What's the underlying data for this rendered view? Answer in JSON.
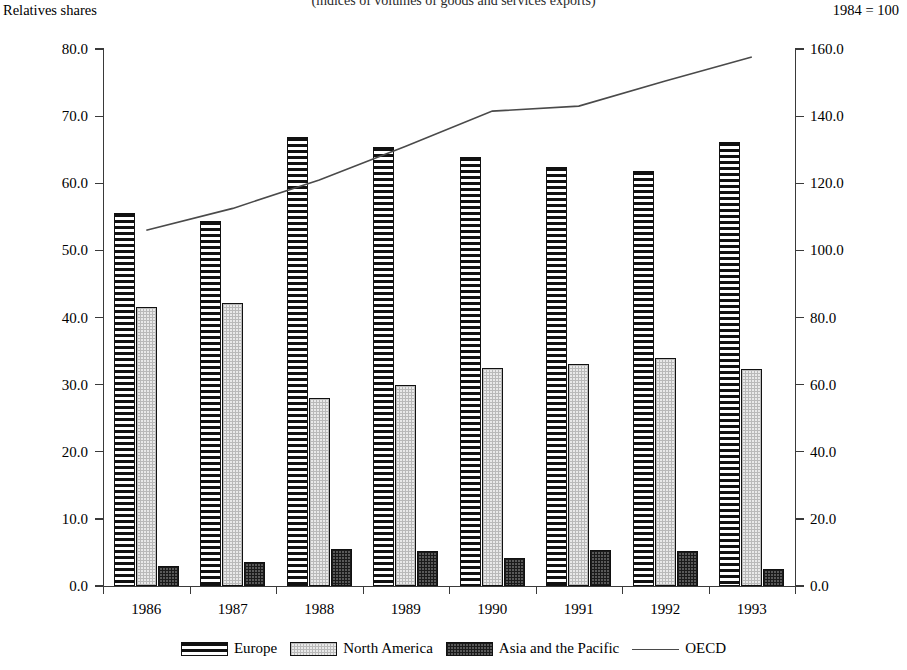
{
  "header": {
    "cut_title": "(indices of volumes of goods and services exports)",
    "left_label": "Relatives shares",
    "right_label": "1984 = 100"
  },
  "legend": {
    "items": [
      {
        "label": "Europe",
        "swatch": "horizontal-stripe-swatch"
      },
      {
        "label": "North America",
        "swatch": "light-dotted-swatch"
      },
      {
        "label": "Asia and the Pacific",
        "swatch": "dark-dotted-swatch"
      },
      {
        "label": "OECD",
        "swatch": "line-swatch"
      }
    ]
  },
  "chart_data": {
    "type": "bar",
    "title": "(indices of volumes of goods and services exports)",
    "xlabel": "",
    "ylabel": "Relatives shares",
    "y2label": "1984 = 100",
    "grid": false,
    "legend_position": "bottom",
    "categories": [
      "1986",
      "1987",
      "1988",
      "1989",
      "1990",
      "1991",
      "1992",
      "1993"
    ],
    "ylim": [
      0.0,
      80.0
    ],
    "yticks": [
      "0.0",
      "10.0",
      "20.0",
      "30.0",
      "40.0",
      "50.0",
      "60.0",
      "70.0",
      "80.0"
    ],
    "y2lim": [
      0.0,
      160.0
    ],
    "y2ticks": [
      "0.0",
      "20.0",
      "40.0",
      "60.0",
      "80.0",
      "100.0",
      "120.0",
      "140.0",
      "160.0"
    ],
    "series": [
      {
        "name": "Europe",
        "axis": "left",
        "kind": "bar",
        "values": [
          55.6,
          54.4,
          66.9,
          65.4,
          63.9,
          62.4,
          61.9,
          66.2
        ]
      },
      {
        "name": "North America",
        "axis": "left",
        "kind": "bar",
        "values": [
          41.6,
          42.2,
          28.0,
          30.0,
          32.5,
          33.1,
          33.9,
          32.4
        ]
      },
      {
        "name": "Asia and the Pacific",
        "axis": "left",
        "kind": "bar",
        "values": [
          3.0,
          3.6,
          5.5,
          5.2,
          4.2,
          5.4,
          5.2,
          2.6
        ]
      },
      {
        "name": "OECD",
        "axis": "right",
        "kind": "line",
        "values": [
          106.0,
          112.5,
          121.0,
          131.0,
          141.5,
          143.0,
          150.5,
          157.6
        ]
      }
    ]
  }
}
